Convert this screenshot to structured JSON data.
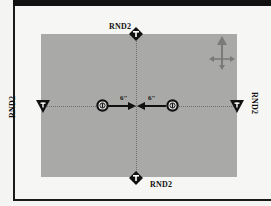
{
  "map": {
    "title": "",
    "board_color": "#a9a9a7",
    "markers": [
      {
        "id": "top",
        "label": "RND2",
        "shape": "diamond",
        "icon": "pin-icon"
      },
      {
        "id": "bottom",
        "label": "RND2",
        "shape": "diamond",
        "icon": "pin-icon"
      },
      {
        "id": "left",
        "label": "RND2",
        "shape": "triangle-down",
        "icon": "pin-icon"
      },
      {
        "id": "right",
        "label": "RND2",
        "shape": "triangle-down",
        "icon": "pin-icon"
      }
    ],
    "objectives": [
      {
        "id": "left-objective",
        "icon": "objective-icon"
      },
      {
        "id": "right-objective",
        "icon": "objective-icon"
      }
    ],
    "distances": {
      "left": "6\"",
      "right": "6\""
    },
    "compass": {
      "icon": "move-arrows-icon"
    }
  }
}
